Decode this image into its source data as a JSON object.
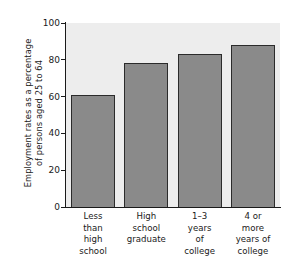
{
  "chart_data": {
    "type": "bar",
    "title": "",
    "subtitle": "",
    "xlabel": "",
    "ylabel": "Employment rates as a percentage of persons aged 25 to 64",
    "ylabel_lines": [
      "Employment rates as a percentage",
      "of persons aged 25 to 64"
    ],
    "categories": [
      "Less than high school",
      "High school graduate",
      "1–3 years of college",
      "4 or more years of college"
    ],
    "category_label_lines": [
      [
        "Less",
        "than",
        "high",
        "school"
      ],
      [
        "High",
        "school",
        "graduate"
      ],
      [
        "1–3",
        "years",
        "of",
        "college"
      ],
      [
        "4 or",
        "more",
        "years of",
        "college"
      ]
    ],
    "values": [
      61,
      78,
      83,
      88
    ],
    "ylim": [
      0,
      100
    ],
    "yticks": [
      100,
      80,
      60,
      40,
      20,
      0
    ],
    "ytick_labels": [
      "100",
      "80",
      "60",
      "40",
      "20",
      "0"
    ],
    "grid": false,
    "legend": null,
    "legend_position": "none",
    "colors": {
      "bar_fill": "#8a8a8a",
      "bar_edge": "#2b2b2b",
      "plot_background": "#ededed",
      "figure_background": "#ffffff",
      "axis": "#1a1a1a",
      "text": "#1a1a1a"
    }
  }
}
